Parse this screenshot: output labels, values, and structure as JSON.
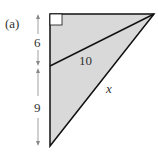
{
  "figure": {
    "part_label": "(a)",
    "segment_top_label": "6",
    "segment_bottom_label": "9",
    "hypotenuse_inner_label": "10",
    "unknown_side_label": "x",
    "colors": {
      "fill": "#d9d9d9",
      "stroke": "#111111",
      "arrow": "#777777",
      "text": "#333333"
    }
  }
}
